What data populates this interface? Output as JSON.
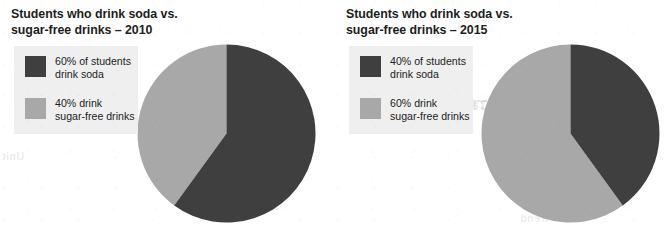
{
  "figure": {
    "background_color": "#ffffff",
    "dark_color": "#3f3f3f",
    "light_color": "#a8a8a8",
    "legend_panel_color": "#efefef"
  },
  "charts": [
    {
      "id": "soda-2010",
      "title_line1": "Students who drink soda vs.",
      "title_line2": "sugar-free drinks – 2010",
      "year": "2010",
      "legend": [
        {
          "swatch": "dark",
          "color": "#3f3f3f",
          "line1": "60% of students",
          "line2": "drink soda"
        },
        {
          "swatch": "light",
          "color": "#a8a8a8",
          "line1": "40% drink",
          "line2": "sugar-free drinks"
        }
      ]
    },
    {
      "id": "soda-2015",
      "title_line1": "Students who drink soda vs.",
      "title_line2": "sugar-free drinks – 2015",
      "year": "2015",
      "legend": [
        {
          "swatch": "dark",
          "color": "#3f3f3f",
          "line1": "40% of students",
          "line2": "drink soda"
        },
        {
          "swatch": "light",
          "color": "#a8a8a8",
          "line1": "60% drink",
          "line2": "sugar-free drinks"
        }
      ]
    }
  ],
  "ghost_text": {
    "a": "Talking about",
    "b": "IMPACT",
    "c": "Look at",
    "d": "a correct",
    "e": "you may",
    "f": "pie",
    "g": "trend",
    "h": "Unit"
  },
  "chart_data": [
    {
      "type": "pie",
      "title": "Students who drink soda vs. sugar-free drinks – 2010",
      "labels": [
        "Drink soda",
        "Drink sugar-free drinks"
      ],
      "values": [
        60,
        40
      ],
      "value_unit": "%",
      "colors": [
        "#3f3f3f",
        "#a8a8a8"
      ],
      "start_angle_deg": 90,
      "direction": "clockwise",
      "legend_position": "left",
      "grid": false
    },
    {
      "type": "pie",
      "title": "Students who drink soda vs. sugar-free drinks – 2015",
      "labels": [
        "Drink soda",
        "Drink sugar-free drinks"
      ],
      "values": [
        40,
        60
      ],
      "value_unit": "%",
      "colors": [
        "#3f3f3f",
        "#a8a8a8"
      ],
      "start_angle_deg": 90,
      "direction": "clockwise",
      "legend_position": "left",
      "grid": false
    }
  ]
}
